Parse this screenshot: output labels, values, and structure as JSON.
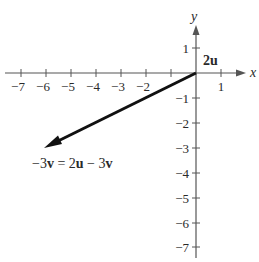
{
  "diagram": {
    "title": "",
    "axes": {
      "x_label": "x",
      "y_label": "y",
      "x_ticks": [
        "−7",
        "−6",
        "−5",
        "−4",
        "−3",
        "−2",
        "1"
      ],
      "y_ticks": [
        "1",
        "−1",
        "−2",
        "−3",
        "−4",
        "−5",
        "−6",
        "−7"
      ],
      "x_range": [
        -7,
        1
      ],
      "y_range": [
        -7,
        1
      ]
    },
    "vectors": [
      {
        "name": "2u",
        "from": [
          0,
          0
        ],
        "to": [
          0,
          0
        ],
        "label": "2u"
      },
      {
        "name": "-3v",
        "from": [
          0,
          0
        ],
        "to": [
          -6,
          -3
        ],
        "label_parts": [
          "−3",
          "v",
          " = 2",
          "u",
          " − 3",
          "v"
        ]
      }
    ],
    "colors": {
      "axis": "#555555",
      "vector": "#111111",
      "text": "#2a2a2a"
    }
  }
}
